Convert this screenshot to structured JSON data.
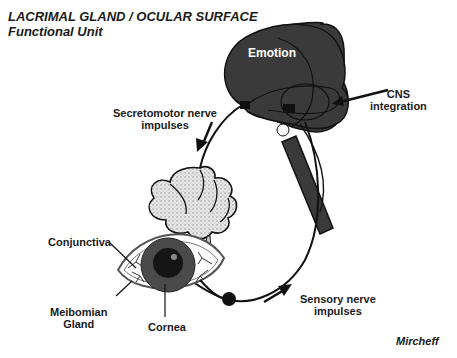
{
  "title": {
    "line1": "LACRIMAL GLAND / OCULAR SURFACE",
    "line2": "Functional Unit"
  },
  "labels": {
    "emotion": "Emotion",
    "cns_line1": "CNS",
    "cns_line2": "integration",
    "secretomotor_line1": "Secretomotor nerve",
    "secretomotor_line2": "impulses",
    "conjunctiva": "Conjunctiva",
    "meibomian_line1": "Meibomian",
    "meibomian_line2": "Gland",
    "cornea": "Cornea",
    "sensory_line1": "Sensory nerve",
    "sensory_line2": "impulses",
    "credit": "Mircheff"
  },
  "colors": {
    "brain": "#3a3a3a",
    "gland": "#d8d8d8",
    "iris": "#4a4a4a",
    "pupil": "#151515",
    "line": "#111111"
  }
}
